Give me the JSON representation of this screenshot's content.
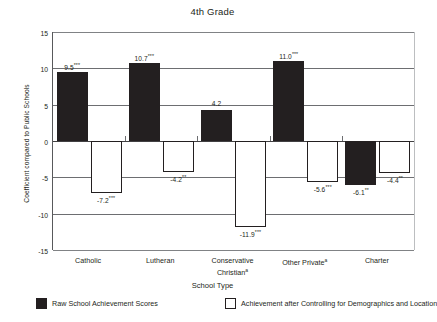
{
  "chart_data": {
    "type": "bar",
    "title": "4th Grade",
    "xlabel": "School Type",
    "ylabel": "Coefficient compared to Public Schools",
    "ylim": [
      -15,
      15
    ],
    "yticks": [
      15,
      10,
      5,
      0,
      -5,
      -10,
      -15
    ],
    "grid": true,
    "legend_position": "bottom",
    "categories": [
      "Catholic",
      "Lutheran",
      "Conservative Christian",
      "Other Private",
      "Charter"
    ],
    "category_lines": [
      [
        "Catholic"
      ],
      [
        "Lutheran"
      ],
      [
        "Conservative",
        "Christian"
      ],
      [
        "Other Private"
      ],
      [
        "Charter"
      ]
    ],
    "category_footnote_marks": [
      "",
      "",
      "a",
      "a",
      ""
    ],
    "series": [
      {
        "name": "Raw School Achievement Scores",
        "color": "#231f20",
        "style": "filled",
        "values": [
          9.5,
          10.7,
          4.2,
          11.0,
          -6.1
        ],
        "labels": [
          "9.5***",
          "10.7***",
          "4.2",
          "11.0***",
          "-6.1**"
        ],
        "label_values": [
          "9.5",
          "10.7",
          "4.2",
          "11.0",
          "-6.1"
        ],
        "label_stars": [
          "***",
          "***",
          "",
          "***",
          "**"
        ]
      },
      {
        "name": "Achievement after Controlling for Demographics and Location",
        "color": "#ffffff",
        "style": "hollow",
        "values": [
          -7.2,
          -4.2,
          -11.9,
          -5.6,
          -4.4
        ],
        "labels": [
          "-7.2***",
          "-4.2**",
          "-11.9***",
          "-5.6***",
          "-4.4**"
        ],
        "label_values": [
          "-7.2",
          "-4.2",
          "-11.9",
          "-5.6",
          "-4.4"
        ],
        "label_stars": [
          "***",
          "**",
          "***",
          "***",
          "**"
        ]
      }
    ]
  },
  "legend": {
    "items": [
      {
        "label": "Raw School Achievement Scores",
        "swatch": "filled"
      },
      {
        "label": "Achievement after Controlling for Demographics and Location",
        "swatch": "hollow"
      }
    ]
  }
}
